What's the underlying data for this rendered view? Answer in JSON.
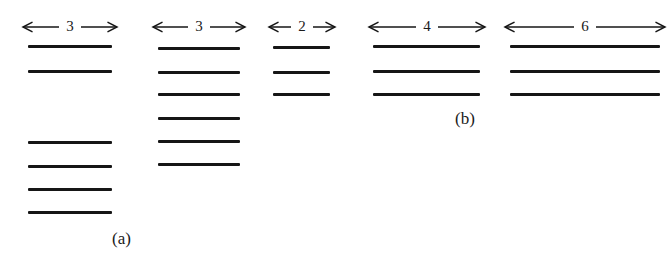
{
  "figure": {
    "width": 670,
    "height": 260,
    "background": "#ffffff",
    "line_color": "#161616",
    "text_color": "#1a1a1a",
    "panel_labels": [
      {
        "text": "(a)",
        "x": 112,
        "y": 230
      },
      {
        "text": "(b)",
        "x": 455,
        "y": 110
      }
    ]
  },
  "chart_data": {
    "type": "diagram",
    "title": "",
    "groups": [
      {
        "id": "group-1",
        "dimension_label": "3",
        "arrow_left": 22,
        "arrow_right": 118,
        "x_left": 28,
        "x_right": 112,
        "line_count": 6,
        "line_y": [
          45,
          70,
          141,
          165,
          188,
          211
        ],
        "panel": "a"
      },
      {
        "id": "group-2",
        "dimension_label": "3",
        "arrow_left": 152,
        "arrow_right": 246,
        "x_left": 158,
        "x_right": 240,
        "line_count": 6,
        "line_y": [
          47,
          71,
          93,
          117,
          140,
          163
        ],
        "panel": "a"
      },
      {
        "id": "group-3",
        "dimension_label": "2",
        "arrow_left": 268,
        "arrow_right": 336,
        "x_left": 273,
        "x_right": 330,
        "line_count": 3,
        "line_y": [
          46,
          71,
          93
        ],
        "panel": "a"
      },
      {
        "id": "group-4",
        "dimension_label": "4",
        "arrow_left": 368,
        "arrow_right": 486,
        "x_left": 373,
        "x_right": 480,
        "line_count": 3,
        "line_y": [
          45,
          70,
          93
        ],
        "panel": "b"
      },
      {
        "id": "group-5",
        "dimension_label": "6",
        "arrow_left": 504,
        "arrow_right": 666,
        "x_left": 510,
        "x_right": 660,
        "line_count": 3,
        "line_y": [
          45,
          70,
          93
        ],
        "panel": "b"
      }
    ],
    "arrow_y": 27,
    "labels": [
      "3",
      "3",
      "2",
      "4",
      "6"
    ],
    "line_counts": [
      6,
      6,
      3,
      3,
      3
    ]
  }
}
